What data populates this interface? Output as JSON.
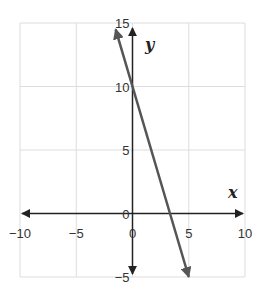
{
  "chart_data": {
    "type": "line",
    "title": "",
    "xlabel": "x",
    "ylabel": "y",
    "xlim": [
      -10,
      10
    ],
    "ylim": [
      -5,
      15
    ],
    "x_ticks": [
      -10,
      -5,
      0,
      5,
      10
    ],
    "y_ticks": [
      -5,
      0,
      5,
      10,
      15
    ],
    "x_tick_labels": [
      "−10",
      "−5",
      "0",
      "5",
      "10"
    ],
    "y_tick_labels": [
      "−5",
      "0",
      "5",
      "10",
      "15"
    ],
    "grid": true,
    "series": [
      {
        "name": "y = -3x + 10",
        "x": [
          -1.5,
          0,
          3.33,
          5
        ],
        "y": [
          14.5,
          10,
          0,
          -5
        ],
        "color": "#555555",
        "arrows_both_ends": true
      }
    ]
  },
  "colors": {
    "grid": "#dddddd",
    "axis": "#222222",
    "line": "#555555"
  }
}
